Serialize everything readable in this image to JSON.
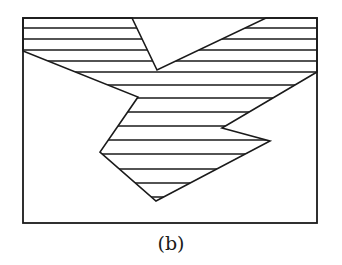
{
  "figure": {
    "caption": "(b)",
    "stroke_color": "#1a1a1a",
    "background": "#ffffff",
    "frame": {
      "x": 23,
      "y": 18,
      "width": 294,
      "height": 205
    },
    "shaded_region": {
      "description": "Irregular polygon region filled with horizontal hatch lines, spanning the top band of the frame (with a V-shaped unshaded notch) and extending down into a pointed lobe",
      "vertices": [
        [
          23,
          18
        ],
        [
          132,
          18
        ],
        [
          157,
          70
        ],
        [
          266,
          18
        ],
        [
          317,
          18
        ],
        [
          317,
          72
        ],
        [
          222,
          128
        ],
        [
          270,
          141
        ],
        [
          156,
          201
        ],
        [
          100,
          152
        ],
        [
          138,
          97
        ],
        [
          23,
          51
        ]
      ],
      "hatch_spacing_px": 13.5,
      "hatch_lines_y": [
        28,
        39,
        50,
        61,
        72,
        85,
        98,
        112,
        126,
        140,
        154,
        169,
        183,
        197
      ]
    }
  }
}
